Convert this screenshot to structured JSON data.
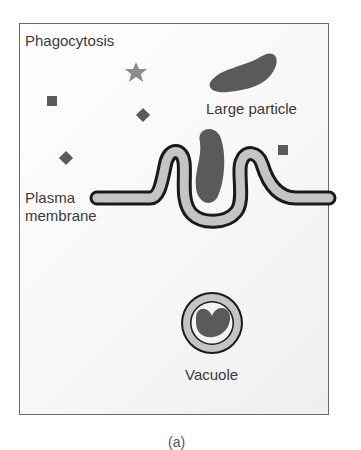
{
  "diagram": {
    "title": "Phagocytosis",
    "labels": {
      "large_particle": "Large particle",
      "plasma_membrane_line1": "Plasma",
      "plasma_membrane_line2": "membrane",
      "vacuole": "Vacuole"
    },
    "caption": "(a)",
    "small_particles": [
      {
        "shape": "star",
        "x": 136,
        "y": 72
      },
      {
        "shape": "square",
        "x": 52,
        "y": 101
      },
      {
        "shape": "diamond",
        "x": 143,
        "y": 115
      },
      {
        "shape": "diamond",
        "x": 66,
        "y": 158
      },
      {
        "shape": "square",
        "x": 283,
        "y": 150
      }
    ],
    "colors": {
      "particle": "#5a5a5a",
      "star": "#8c8c8c",
      "membrane_fill": "#c4c4c4",
      "membrane_outline": "#1a1a1a",
      "frame": "#6a6a6a",
      "text": "#3a3a3a"
    }
  }
}
